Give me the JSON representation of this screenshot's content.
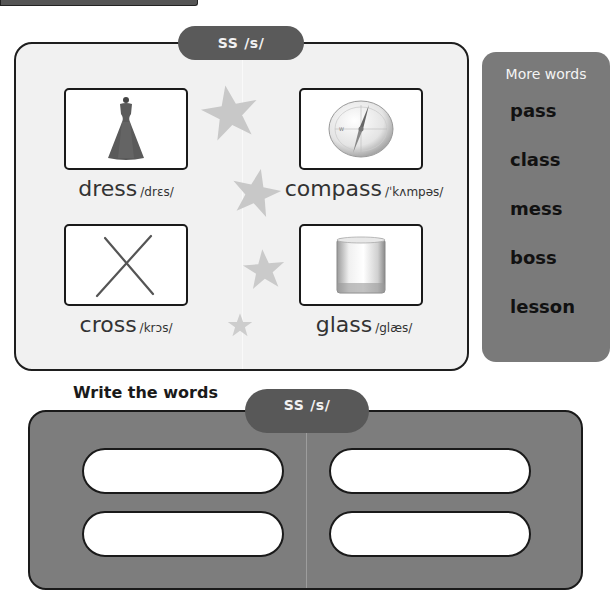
{
  "header": {
    "partial_bar": ""
  },
  "top_panel": {
    "tab": {
      "letters": "SS",
      "phoneme": "/s/"
    },
    "words": [
      {
        "word": "dress",
        "phonetic": "/drɛs/",
        "icon": "dress-icon"
      },
      {
        "word": "compass",
        "phonetic": "/ˈkʌmpəs/",
        "icon": "compass-icon"
      },
      {
        "word": "cross",
        "phonetic": "/krɔs/",
        "icon": "cross-icon"
      },
      {
        "word": "glass",
        "phonetic": "/glæs/",
        "icon": "glass-icon"
      }
    ],
    "decorations": [
      "star-icon",
      "star-icon",
      "star-icon",
      "star-icon"
    ]
  },
  "more_words": {
    "title": "More words",
    "items": [
      "pass",
      "class",
      "mess",
      "boss",
      "lesson"
    ]
  },
  "write_section": {
    "title": "Write the words",
    "tab": {
      "letters": "SS",
      "phoneme": "/s/"
    },
    "answer_boxes": [
      "",
      "",
      "",
      ""
    ]
  },
  "colors": {
    "panel_bg": "#f1f1f1",
    "tab_bg": "#5a5a5a",
    "more_panel_bg": "#7a7a7a",
    "write_panel_bg": "#7d7d7d",
    "star": "#c8c8c8",
    "border": "#1e1e1e"
  }
}
